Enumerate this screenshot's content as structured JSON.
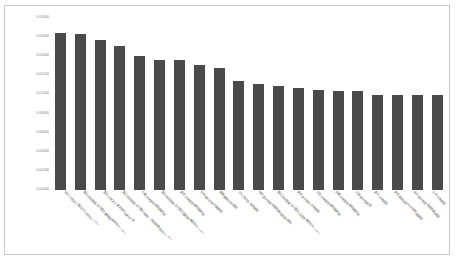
{
  "chart": {
    "type": "bar",
    "title": "",
    "frame_border_color": "#c8c8c8",
    "bar_color": "#4a4a4a",
    "background": "#ffffff",
    "grid": false,
    "legend": "none"
  },
  "chart_data": {
    "type": "bar",
    "title": "",
    "xlabel": "",
    "ylabel": "",
    "ylim": [
      0.0,
      0.018
    ],
    "ytick_labels": [
      "0.01800",
      "0.01600",
      "0.01400",
      "0.01200",
      "0.01000",
      "0.00800",
      "0.00600",
      "0.00400",
      "0.00200",
      "0.00000"
    ],
    "ytick_values": [
      0.018,
      0.016,
      0.014,
      0.012,
      0.01,
      0.008,
      0.006,
      0.004,
      0.002,
      0.0
    ],
    "grid": false,
    "legend_position": "none",
    "categories": [
      "独立行政法人国立がん研究センター",
      "国立研究開発法人国立循環器病研究センター",
      "国立大学法人東京医科歯科大学",
      "国立研究開発法人国立精神・神経医療研究センター",
      "千葉大学医学部附属病院",
      "国立研究開発法人国立国際医療研究センター",
      "東京大学医学部附属病院",
      "日本医科大学付属病院",
      "慶應義塾大学病院",
      "がん研究会 有明病院",
      "順天堂大学医学部附属順天堂医院",
      "国立研究開発法人国立成育医療研究センター",
      "東京女子医科大学病院",
      "大阪大学医学部附属病院",
      "京都大学医学部附属病院",
      "北海道大学病院",
      "東北大学病院",
      "東京慈恵会医科大学附属病院",
      "名古屋大学医学部附属病院",
      "九州大学病院"
    ],
    "values": [
      0.0164,
      0.01635,
      0.01565,
      0.0151,
      0.01405,
      0.0136,
      0.0136,
      0.0131,
      0.0128,
      0.01145,
      0.01105,
      0.0109,
      0.01065,
      0.01045,
      0.0104,
      0.01035,
      0.00995,
      0.0099,
      0.0099,
      0.0099
    ]
  }
}
